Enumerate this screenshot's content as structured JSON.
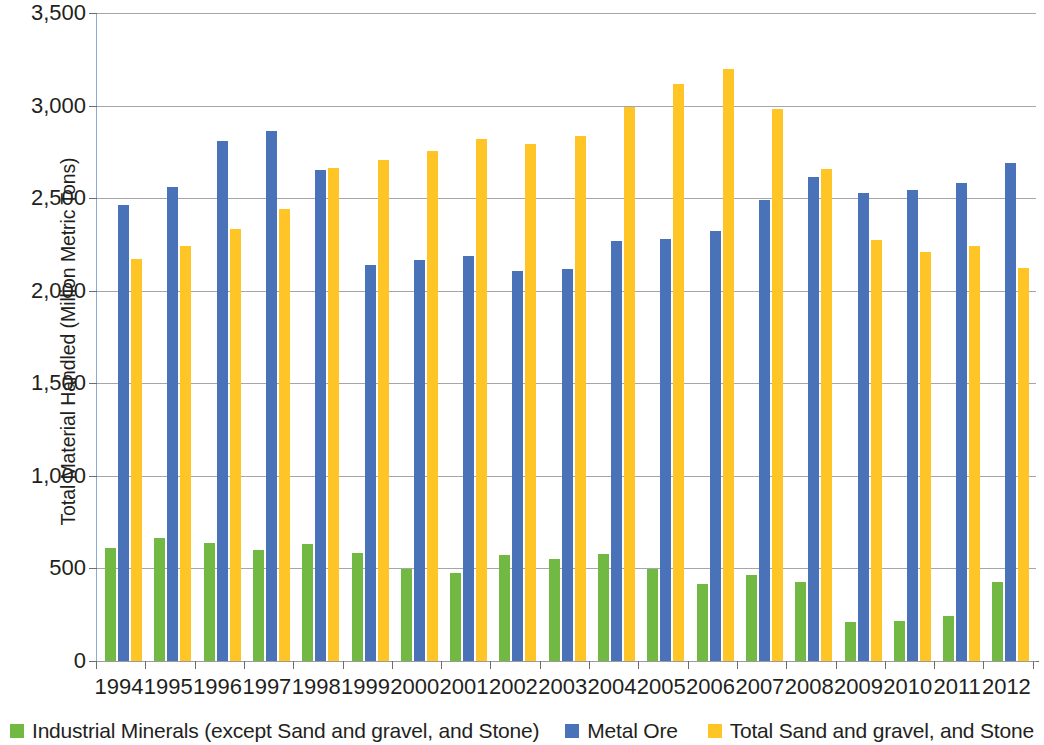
{
  "chart_data": {
    "type": "bar",
    "title": "",
    "subtitle": "",
    "xlabel": "",
    "ylabel": "Total Material Handled (Million Metric Tons)",
    "ylim": [
      0,
      3500
    ],
    "ytick_labels": [
      "3,500",
      "3,000",
      "2,500",
      "2,000",
      "1,500",
      "1,000",
      "500",
      "0"
    ],
    "ytick_values": [
      3500,
      3000,
      2500,
      2000,
      1500,
      1000,
      500,
      0
    ],
    "grid": "horizontal",
    "legend_position": "bottom",
    "categories": [
      "1994",
      "1995",
      "1996",
      "1997",
      "1998",
      "1999",
      "2000",
      "2001",
      "2002",
      "2003",
      "2004",
      "2005",
      "2006",
      "2007",
      "2008",
      "2009",
      "2010",
      "2011",
      "2012"
    ],
    "series": [
      {
        "name": "Industrial Minerals (except Sand and gravel, and Stone)",
        "color": "#72b944",
        "values": [
          612,
          667,
          640,
          598,
          633,
          585,
          497,
          473,
          575,
          549,
          576,
          497,
          415,
          462,
          425,
          212,
          216,
          245,
          428
        ]
      },
      {
        "name": "Metal Ore",
        "color": "#4a72b8",
        "values": [
          2465,
          2562,
          2810,
          2862,
          2652,
          2138,
          2165,
          2188,
          2108,
          2115,
          2268,
          2280,
          2320,
          2490,
          2612,
          2530,
          2543,
          2580,
          2690
        ]
      },
      {
        "name": "Total Sand and gravel, and Stone",
        "color": "#ffc425",
        "values": [
          2172,
          2243,
          2333,
          2442,
          2663,
          2705,
          2755,
          2818,
          2795,
          2835,
          2990,
          3118,
          3198,
          2982,
          2655,
          2272,
          2208,
          2243,
          2123
        ]
      }
    ]
  }
}
